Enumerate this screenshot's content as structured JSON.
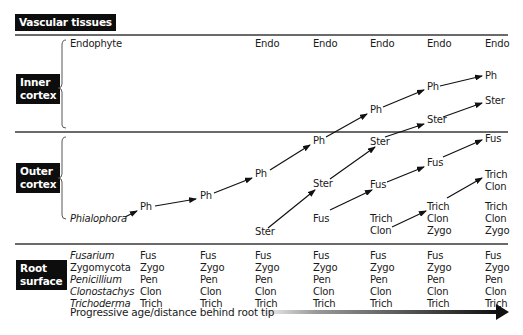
{
  "zones": {
    "vascular": "Vascular tissues",
    "inner_cortex": [
      "Inner",
      "cortex"
    ],
    "outer_cortex": [
      "Outer",
      "cortex"
    ],
    "root_surface": [
      "Root",
      "surface"
    ]
  },
  "inner": {
    "endophyte_label": "Endophyte",
    "endo_columns": [
      "Endo",
      "Endo",
      "Endo",
      "Endo",
      "Endo"
    ]
  },
  "outer": {
    "phialophora_label": "Phialophora"
  },
  "nodes": {
    "ph": [
      "Ph",
      "Ph",
      "Ph",
      "Ph",
      "Ph",
      "Ph",
      "Ph"
    ],
    "ster": [
      "Ster",
      "Ster",
      "Ster",
      "Ster",
      "Ster"
    ],
    "fus": [
      "Fus",
      "Fus",
      "Fus",
      "Fus"
    ],
    "trich_clon_col5": [
      "Trich",
      "Clon"
    ],
    "trich_clon_zygo_col6": [
      "Trich",
      "Clon",
      "Zygo"
    ],
    "trich_clon_col7_upper": [
      "Trich",
      "Clon"
    ],
    "trich_clon_zygo_col7_lower": [
      "Trich",
      "Clon",
      "Zygo"
    ]
  },
  "root_surface": {
    "taxa": [
      {
        "name": "Fusarium",
        "italic": true
      },
      {
        "name": "Zygomycota",
        "italic": false
      },
      {
        "name": "Penicillium",
        "italic": true
      },
      {
        "name": "Clonostachys",
        "italic": true
      },
      {
        "name": "Trichoderma",
        "italic": true
      }
    ],
    "abbrev": [
      "Fus",
      "Zygo",
      "Pen",
      "Clon",
      "Trich"
    ],
    "column_count": 7
  },
  "axis": {
    "label": "Progressive age/distance behind root tip"
  },
  "colors": {
    "label_bg": "#0d0d0d",
    "divider": "#6a6a6a",
    "arrow": "#111111"
  }
}
